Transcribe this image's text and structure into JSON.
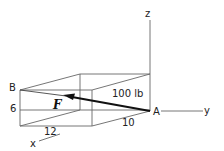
{
  "diagram": {
    "type": "3D force vector on rectangular box",
    "axes": {
      "x": "x",
      "y": "y",
      "z": "z"
    },
    "points": {
      "A": "A",
      "B": "B"
    },
    "force": {
      "symbol": "F",
      "magnitude": "100 lb"
    },
    "dimensions": {
      "height": "6",
      "length_x": "12",
      "length_y": "10"
    },
    "colors": {
      "line": "#555555",
      "force": "#111111",
      "background": "#ffffff"
    }
  }
}
